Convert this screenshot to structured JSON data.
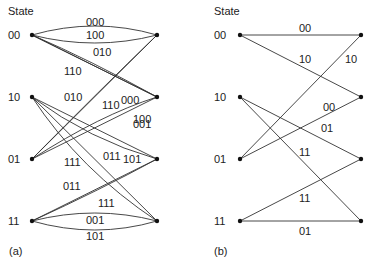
{
  "panels": [
    {
      "id": "a",
      "caption": "(a)",
      "state_header": "State",
      "states": [
        "00",
        "10",
        "01",
        "11"
      ],
      "edges": [
        {
          "from": "00",
          "to": "00",
          "label": "000"
        },
        {
          "from": "00",
          "to": "00",
          "label": "100"
        },
        {
          "from": "00",
          "to": "10",
          "label": "010"
        },
        {
          "from": "00",
          "to": "10",
          "label": "110"
        },
        {
          "from": "10",
          "to": "01",
          "label": "001"
        },
        {
          "from": "10",
          "to": "01",
          "label": "101"
        },
        {
          "from": "10",
          "to": "11",
          "label": "011"
        },
        {
          "from": "10",
          "to": "11",
          "label": "111"
        },
        {
          "from": "01",
          "to": "00",
          "label": "010"
        },
        {
          "from": "01",
          "to": "00",
          "label": "110"
        },
        {
          "from": "01",
          "to": "10",
          "label": "000"
        },
        {
          "from": "01",
          "to": "10",
          "label": "100"
        },
        {
          "from": "11",
          "to": "01",
          "label": "011"
        },
        {
          "from": "11",
          "to": "01",
          "label": "111"
        },
        {
          "from": "11",
          "to": "11",
          "label": "001"
        },
        {
          "from": "11",
          "to": "11",
          "label": "101"
        }
      ]
    },
    {
      "id": "b",
      "caption": "(b)",
      "state_header": "State",
      "states": [
        "00",
        "10",
        "01",
        "11"
      ],
      "edges": [
        {
          "from": "00",
          "to": "00",
          "label": "00"
        },
        {
          "from": "00",
          "to": "10",
          "label": "10"
        },
        {
          "from": "10",
          "to": "01",
          "label": "01"
        },
        {
          "from": "10",
          "to": "11",
          "label": "11"
        },
        {
          "from": "01",
          "to": "00",
          "label": "10"
        },
        {
          "from": "01",
          "to": "10",
          "label": "00"
        },
        {
          "from": "11",
          "to": "01",
          "label": "11"
        },
        {
          "from": "11",
          "to": "11",
          "label": "01"
        }
      ]
    }
  ]
}
